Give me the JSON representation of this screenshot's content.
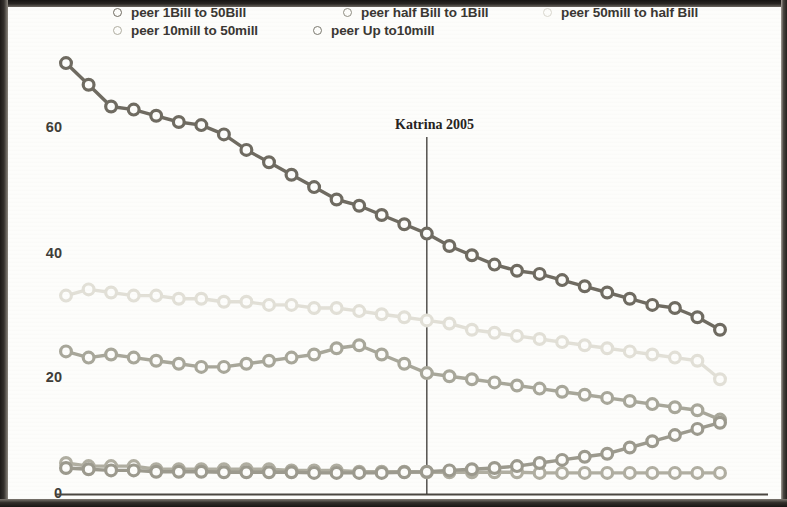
{
  "chart_data": {
    "type": "line",
    "title": "",
    "xlabel": "",
    "ylabel": "",
    "ylim": [
      0,
      70
    ],
    "yticks": [
      0,
      20,
      40,
      60
    ],
    "ytick_labels": [
      "0",
      "20",
      "40",
      "60"
    ],
    "grid": false,
    "legend_position": "top",
    "x": [
      1,
      2,
      3,
      4,
      5,
      6,
      7,
      8,
      9,
      10,
      11,
      12,
      13,
      14,
      15,
      16,
      17,
      18,
      19,
      20,
      21,
      22,
      23,
      24,
      25,
      26,
      27,
      28,
      29,
      30
    ],
    "annotations": [
      {
        "label": "Katrina 2005",
        "type": "vertical-line",
        "x_index": 16,
        "color": "#3a3734"
      }
    ],
    "series": [
      {
        "name": "peer 1Bill to 50Bill",
        "color": "#6f6b61",
        "values": [
          69.5,
          66.0,
          62.5,
          62.0,
          61.0,
          60.0,
          59.5,
          58.0,
          55.5,
          53.5,
          51.5,
          49.5,
          47.5,
          46.5,
          45.0,
          43.5,
          42.0,
          40.0,
          38.5,
          37.0,
          36.0,
          35.5,
          34.5,
          33.5,
          32.5,
          31.5,
          30.5,
          30.0,
          28.5,
          26.5
        ]
      },
      {
        "name": "peer half Bill to 1Bill",
        "color": "#a8a79a",
        "values": [
          23.0,
          22.0,
          22.5,
          22.0,
          21.5,
          21.0,
          20.5,
          20.5,
          21.0,
          21.5,
          22.0,
          22.5,
          23.5,
          24.0,
          22.5,
          21.0,
          19.5,
          19.0,
          18.5,
          18.0,
          17.5,
          17.0,
          16.5,
          16.0,
          15.5,
          15.0,
          14.5,
          14.0,
          13.5,
          12.0
        ]
      },
      {
        "name": "peer 50mill to half Bill",
        "color": "#e2e0d7",
        "values": [
          32.0,
          33.0,
          32.5,
          32.0,
          32.0,
          31.5,
          31.5,
          31.0,
          31.0,
          30.5,
          30.5,
          30.0,
          30.0,
          29.5,
          29.0,
          28.5,
          28.0,
          27.5,
          26.5,
          26.0,
          25.5,
          25.0,
          24.5,
          24.0,
          23.5,
          23.0,
          22.5,
          22.0,
          21.5,
          18.5
        ]
      },
      {
        "name": "peer 10mill to 50mill",
        "color": "#b0aea1",
        "values": [
          5.0,
          4.5,
          4.5,
          4.5,
          4.0,
          4.0,
          4.0,
          4.0,
          4.0,
          4.0,
          3.8,
          3.8,
          3.8,
          3.6,
          3.6,
          3.6,
          3.5,
          3.5,
          3.5,
          3.5,
          3.5,
          3.4,
          3.4,
          3.4,
          3.4,
          3.4,
          3.4,
          3.4,
          3.4,
          3.4
        ]
      },
      {
        "name": "peer Up to10mill",
        "color": "#9c9a8e",
        "values": [
          4.2,
          4.0,
          3.8,
          3.8,
          3.6,
          3.6,
          3.6,
          3.5,
          3.5,
          3.5,
          3.5,
          3.4,
          3.4,
          3.4,
          3.4,
          3.5,
          3.6,
          3.8,
          4.0,
          4.2,
          4.5,
          5.0,
          5.5,
          6.0,
          6.5,
          7.5,
          8.5,
          9.5,
          10.5,
          11.5
        ]
      }
    ]
  },
  "legend": {
    "rows": [
      [
        {
          "label": "peer 1Bill to 50Bill",
          "color": "#6f6b61",
          "left": 0
        },
        {
          "label": "peer half Bill to 1Bill",
          "color": "#8f8d82",
          "left": 230
        },
        {
          "label": "peer 50mill to half Bill",
          "color": "#d9d7ce",
          "left": 430
        }
      ],
      [
        {
          "label": "peer 10mill to 50mill",
          "color": "#b0aea1",
          "left": 0
        },
        {
          "label": "peer Up to10mill",
          "color": "#7c7a70",
          "left": 200
        }
      ]
    ]
  },
  "axis": {
    "y_labels": [
      {
        "text": "60",
        "top": 112
      },
      {
        "text": "40",
        "top": 238
      },
      {
        "text": "20",
        "top": 362
      },
      {
        "text": "0",
        "top": 478
      }
    ]
  },
  "colors": {
    "background": "#fdfdfb",
    "frame": "#1d1a18",
    "axis_line": "#4a4640",
    "text": "#3a3733"
  }
}
